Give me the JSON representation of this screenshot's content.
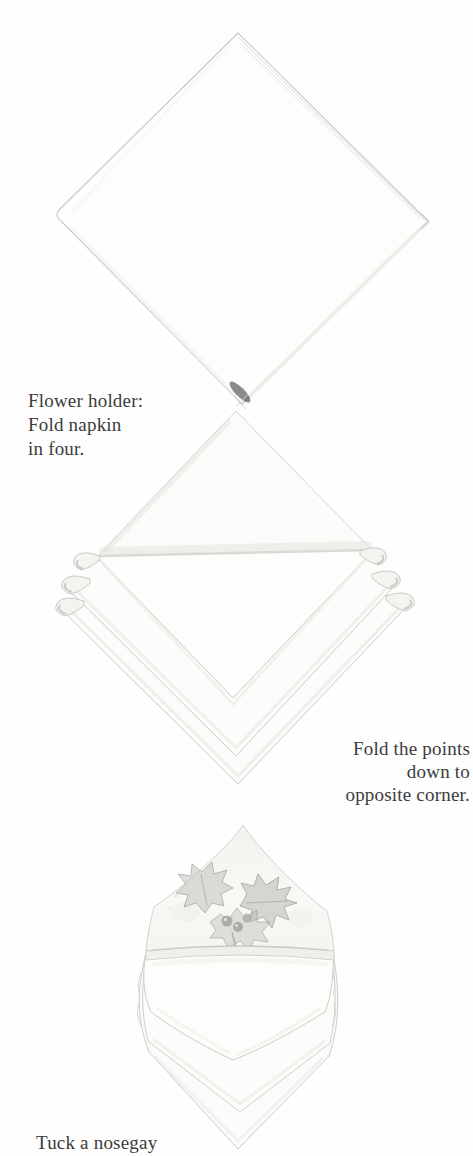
{
  "page": {
    "background_color": "#fefefe",
    "text_color": "#3b3b3b"
  },
  "captions": {
    "step1": {
      "line1": "Flower holder:",
      "line2": "Fold napkin",
      "line3": "in four."
    },
    "step2": {
      "line1": "Fold the points",
      "line2": "down to",
      "line3": "opposite corner."
    },
    "step3": {
      "line1": "Tuck a nosegay"
    }
  },
  "illustrations": {
    "step1": {
      "name": "napkin-folded-in-four",
      "alt": "Pencil drawing of a square napkin folded in four, shown as a diamond with layered open edges along the upper right side"
    },
    "step2": {
      "name": "napkin-points-folded-down",
      "alt": "Pencil drawing of the napkin with its points folded down to the opposite corner, forming nested triangle layers with small rolled corners at each side"
    },
    "step3": {
      "name": "flower-holder-with-nosegay",
      "alt": "Pencil drawing of the finished flower holder fold with a holly nosegay tucked into the pocket"
    }
  },
  "palette": {
    "outline": "#c9c9c5",
    "shading_light": "#ececе8",
    "shading_medium": "#d7d7d2",
    "napkin_fill": "#fdfdfc",
    "holly_leaf": "#b0b0ab",
    "holly_outline": "#96968f",
    "berry": "#a3a39e"
  }
}
